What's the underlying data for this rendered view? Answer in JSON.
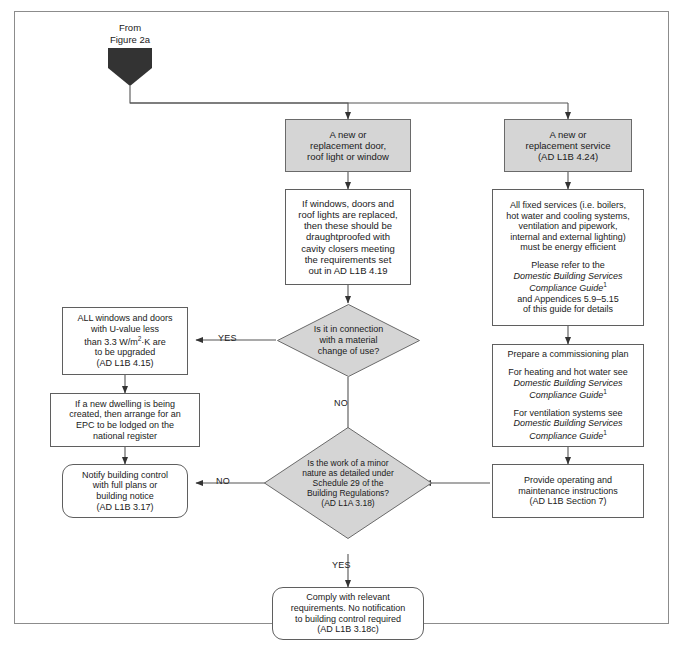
{
  "figure": {
    "entry_label_line1": "From",
    "entry_label_line2": "Figure 2a",
    "entry_marker": "pentagon-connector"
  },
  "nodes": {
    "door_window": {
      "name": "a-new-or-replacement-door",
      "style": "shaded-rect",
      "lines": [
        "A new or",
        "replacement door,",
        "roof light or window"
      ]
    },
    "draughtproof": {
      "name": "draughtproofing-requirements",
      "style": "rect",
      "lines": [
        "If windows, doors and",
        "roof lights are replaced,",
        "then these should be",
        "draughtproofed with",
        "cavity closers meeting",
        "the requirements set",
        "out in AD L1B 4.19"
      ]
    },
    "service": {
      "name": "a-new-or-replacement-service",
      "style": "shaded-rect",
      "lines": [
        "A new or",
        "replacement service",
        "(AD L1B 4.24)"
      ]
    },
    "fixed_services": {
      "name": "all-fixed-services-energy-efficient",
      "style": "rect",
      "block1": [
        "All fixed services (i.e. boilers,",
        "hot water and cooling systems,",
        "ventilation and pipework,",
        "internal and external lighting)",
        "must be energy efficient"
      ],
      "block2_intro": "Please refer to the",
      "block2_italic1": "Domestic Building Services",
      "block2_italic2": "Compliance Guide",
      "block2_sup": "1",
      "block2_rest": [
        "and Appendices 5.9–5.15",
        "of this guide for details"
      ]
    },
    "commissioning": {
      "name": "prepare-a-commissioning-plan",
      "style": "rect",
      "heading": "Prepare a commissioning plan",
      "part1_intro": "For heating and hot water see",
      "part1_italic1": "Domestic Building Services",
      "part1_italic2": "Compliance Guide",
      "part1_sup": "1",
      "part2_intro": "For ventilation systems see",
      "part2_italic1": "Domestic Building Services",
      "part2_italic2": "Compliance Guide",
      "part2_sup": "1"
    },
    "operating": {
      "name": "provide-operating-and-maintenance-instructions",
      "style": "rect",
      "lines": [
        "Provide operating and",
        "maintenance instructions",
        "(AD L1B Section 7)"
      ]
    },
    "upgrade_uvalue": {
      "name": "all-windows-and-doors-u-value",
      "style": "rect",
      "line1": "ALL windows and doors",
      "line2": "with U-value less",
      "line3_a": "than 3.3 W/m",
      "line3_sup": "2",
      "line3_b": "·K are",
      "line4": "to be upgraded",
      "line5": "(AD L1B 4.15)"
    },
    "epc": {
      "name": "new-dwelling-epc-lodged",
      "style": "rect",
      "lines": [
        "If a new dwelling is being",
        "created, then arrange for an",
        "EPC to be lodged on the",
        "national register"
      ]
    },
    "notify": {
      "name": "notify-building-control",
      "style": "rounded-rect",
      "lines": [
        "Notify building control",
        "with full plans or",
        "building notice",
        "(AD L1B 3.17)"
      ]
    },
    "comply": {
      "name": "comply-with-relevant-requirements",
      "style": "rounded-rect",
      "lines": [
        "Comply with relevant",
        "requirements. No notification",
        "to building control required",
        "(AD L1B 3.18c)"
      ]
    }
  },
  "decisions": {
    "material_change": {
      "name": "is-it-in-connection-with-a-material-change-of-use",
      "lines": [
        "Is it in connection",
        "with a material",
        "change of use?"
      ]
    },
    "minor_nature": {
      "name": "is-the-work-of-a-minor-nature",
      "lines": [
        "Is the work of a minor",
        "nature as detailed under",
        "Schedule 29 of the",
        "Building Regulations?",
        "(AD L1A 3.18)"
      ]
    }
  },
  "edge_labels": {
    "material_change_yes": "YES",
    "material_change_no": "NO",
    "minor_nature_no": "NO",
    "minor_nature_yes": "YES"
  },
  "colors": {
    "shaded_fill": "#d5d5d5",
    "box_border": "#5f5f5f",
    "frame_border": "#8c8c8c",
    "connector": "#555555",
    "pentagon_fill": "#333333",
    "text": "#1a1a1a"
  }
}
